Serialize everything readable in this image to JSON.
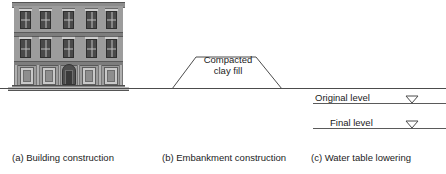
{
  "figure": {
    "ground_line_label": "ground-surface"
  },
  "panels": {
    "a": {
      "caption": "(a) Building construction",
      "subject": "masonry-building-facade",
      "storeys": 3,
      "bays": 5
    },
    "b": {
      "caption": "(b) Embankment construction",
      "fill_label_line1": "Compacted",
      "fill_label_line2": "clay fill",
      "fill_label": "Compacted clay fill",
      "shape": "trapezoid-embankment"
    },
    "c": {
      "caption": "(c) Water table lowering",
      "levels": [
        {
          "label": "Original level",
          "symbol": "water-table-triangle"
        },
        {
          "label": "Final level",
          "symbol": "water-table-triangle"
        }
      ]
    }
  },
  "colors": {
    "line": "#4c4c4c",
    "text": "#1b1b1b",
    "facade": "#9c9c9c",
    "background": "#ffffff"
  }
}
